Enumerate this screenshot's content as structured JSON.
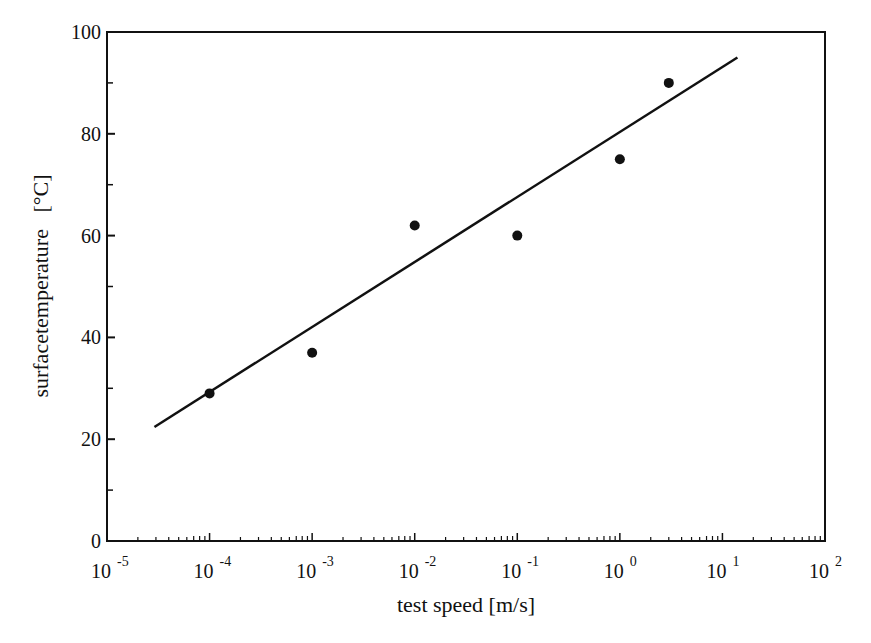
{
  "chart_data": {
    "type": "scatter",
    "title": "",
    "xlabel": "test speed [m/s]",
    "ylabel": "surfacetemperature   [°C]",
    "xscale": "log",
    "xlim": [
      1e-05,
      100
    ],
    "ylim": [
      0,
      100
    ],
    "x_tick_labels": [
      {
        "base": "10",
        "exp": "-5"
      },
      {
        "base": "10",
        "exp": "-4"
      },
      {
        "base": "10",
        "exp": "-3"
      },
      {
        "base": "10",
        "exp": "-2"
      },
      {
        "base": "10",
        "exp": "-1"
      },
      {
        "base": "10",
        "exp": "0"
      },
      {
        "base": "10",
        "exp": "1"
      },
      {
        "base": "10",
        "exp": "2"
      }
    ],
    "y_tick_labels": [
      "0",
      "20",
      "40",
      "60",
      "80",
      "100"
    ],
    "y_minor_ticks": [
      10,
      30,
      50,
      70,
      90
    ],
    "grid": false,
    "legend": null,
    "series": [
      {
        "name": "measured",
        "type": "scatter",
        "marker": "filled-circle",
        "x": [
          0.0001,
          0.001,
          0.01,
          0.1,
          1,
          3
        ],
        "y": [
          29,
          37,
          62,
          60,
          75,
          90
        ]
      },
      {
        "name": "linear fit",
        "type": "line",
        "x": [
          2.9e-05,
          14
        ],
        "y": [
          22.4,
          95
        ]
      }
    ]
  },
  "colors": {
    "ink": "#111111",
    "background": "#ffffff"
  }
}
